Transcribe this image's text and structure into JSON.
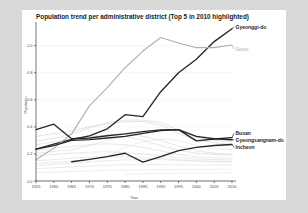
{
  "chart_data": {
    "type": "line",
    "title": "Population trend per administrative district (Top 5 in 2010 highlighted)",
    "xlabel": "Year",
    "ylabel": "Population",
    "x": [
      1955,
      1960,
      1965,
      1970,
      1975,
      1980,
      1985,
      1990,
      1995,
      2000,
      2005,
      2010
    ],
    "xticks": [
      "1955",
      "1960",
      "1965",
      "1970",
      "1975",
      "1980",
      "1985",
      "1990",
      "1995",
      "2000",
      "2005",
      "2010"
    ],
    "yticks": [
      "0.0",
      "0.2",
      "0.4",
      "0.6",
      "0.8",
      "1.0"
    ],
    "ytickvals": [
      0.0,
      0.2,
      0.4,
      0.6,
      0.8,
      1.0
    ],
    "xlim": [
      1955,
      2010
    ],
    "ylim": [
      0.0,
      1.16
    ],
    "grid": true,
    "legend": "inline-right-labels",
    "highlight_color": "#262626",
    "seoul_color": "#b0b0b0",
    "background_color": "#cfcfcf",
    "series": [
      {
        "name": "Gyeonggi-do",
        "highlighted": true,
        "color": "#262626",
        "label_x": 2010,
        "label_y": 1.14,
        "values": [
          0.235,
          0.272,
          0.308,
          0.334,
          0.386,
          0.49,
          0.476,
          0.66,
          0.8,
          0.9,
          1.03,
          1.125
        ]
      },
      {
        "name": "Seoul",
        "highlighted": true,
        "color": "#b0b0b0",
        "label_x": 2010,
        "label_y": 0.975,
        "values": [
          0.157,
          0.243,
          0.348,
          0.555,
          0.69,
          0.837,
          0.96,
          1.06,
          1.02,
          0.985,
          0.985,
          1.005
        ]
      },
      {
        "name": "Busan",
        "highlighted": true,
        "color": "#262626",
        "label_x": 2010,
        "label_y": 0.352,
        "values": [
          0.38,
          0.42,
          0.312,
          0.318,
          0.334,
          0.348,
          0.365,
          0.378,
          0.38,
          0.296,
          0.31,
          0.32
        ]
      },
      {
        "name": "Gyeongsangnam-do",
        "highlighted": true,
        "color": "#262626",
        "label_x": 2010,
        "label_y": 0.305,
        "values": [
          0.235,
          0.262,
          0.3,
          0.306,
          0.318,
          0.33,
          0.352,
          0.372,
          0.38,
          0.33,
          0.312,
          0.305
        ]
      },
      {
        "name": "Incheon",
        "highlighted": true,
        "color": "#262626",
        "label_x": 2010,
        "label_y": 0.248,
        "values": [
          null,
          null,
          0.142,
          0.16,
          0.18,
          0.205,
          0.14,
          0.18,
          0.225,
          0.248,
          0.262,
          0.27
        ]
      },
      {
        "name": "other-1",
        "highlighted": false,
        "color": "#cccccc",
        "values": [
          0.295,
          0.315,
          0.345,
          0.392,
          0.432,
          0.45,
          0.45,
          0.432,
          0.375,
          0.322,
          0.3,
          0.292
        ]
      },
      {
        "name": "other-2",
        "highlighted": false,
        "color": "#cfcfcf",
        "values": [
          0.33,
          0.35,
          0.368,
          0.402,
          0.42,
          0.438,
          0.44,
          0.412,
          0.352,
          0.3,
          0.282,
          0.272
        ]
      },
      {
        "name": "other-3",
        "highlighted": false,
        "color": "#d2d2d2",
        "values": [
          0.268,
          0.29,
          0.308,
          0.33,
          0.34,
          0.348,
          0.33,
          0.3,
          0.258,
          0.222,
          0.205,
          0.198
        ]
      },
      {
        "name": "other-4",
        "highlighted": false,
        "color": "#d5d5d5",
        "values": [
          0.225,
          0.24,
          0.255,
          0.268,
          0.275,
          0.268,
          0.248,
          0.222,
          0.196,
          0.178,
          0.17,
          0.168
        ]
      },
      {
        "name": "other-5",
        "highlighted": false,
        "color": "#d8d8d8",
        "values": [
          0.185,
          0.196,
          0.206,
          0.214,
          0.216,
          0.21,
          0.198,
          0.186,
          0.172,
          0.162,
          0.158,
          0.156
        ]
      },
      {
        "name": "other-6",
        "highlighted": false,
        "color": "#d8d8d8",
        "values": [
          0.15,
          0.158,
          0.168,
          0.176,
          0.18,
          0.178,
          0.172,
          0.166,
          0.158,
          0.15,
          0.146,
          0.144
        ]
      },
      {
        "name": "other-7",
        "highlighted": false,
        "color": "#dadada",
        "values": [
          0.112,
          0.122,
          0.132,
          0.142,
          0.15,
          0.156,
          0.158,
          0.158,
          0.152,
          0.146,
          0.142,
          0.14
        ]
      },
      {
        "name": "other-8",
        "highlighted": false,
        "color": "#dcdcdc",
        "values": [
          0.092,
          0.098,
          0.104,
          0.11,
          0.116,
          0.12,
          0.122,
          0.122,
          0.12,
          0.118,
          0.118,
          0.118
        ]
      },
      {
        "name": "other-9",
        "highlighted": false,
        "color": "#dedede",
        "values": [
          0.062,
          0.066,
          0.07,
          0.075,
          0.079,
          0.082,
          0.084,
          0.086,
          0.086,
          0.086,
          0.086,
          0.086
        ]
      },
      {
        "name": "other-10",
        "highlighted": false,
        "color": "#e0e0e0",
        "values": [
          null,
          null,
          null,
          null,
          null,
          0.05,
          0.052,
          0.054,
          0.056,
          0.058,
          0.06,
          0.062
        ]
      },
      {
        "name": "other-11",
        "highlighted": false,
        "color": "#dcdcdc",
        "values": [
          0.128,
          0.136,
          0.145,
          0.16,
          0.172,
          0.25,
          0.29,
          0.308,
          0.3,
          0.262,
          0.24,
          0.232
        ]
      },
      {
        "name": "other-12",
        "highlighted": false,
        "color": "#d6d6d6",
        "values": [
          0.205,
          0.218,
          0.232,
          0.262,
          0.3,
          0.33,
          0.3,
          0.262,
          0.228,
          0.205,
          0.196,
          0.19
        ]
      }
    ],
    "annotations": [
      {
        "text": "Gyeonggi-do",
        "bold": true,
        "color": "#222222"
      },
      {
        "text": "Seoul",
        "bold": false,
        "color": "#b0b0b0"
      },
      {
        "text": "Busan",
        "bold": true,
        "color": "#222222"
      },
      {
        "text": "Gyeongsangnam-do",
        "bold": true,
        "color": "#222222"
      },
      {
        "text": "Incheon",
        "bold": true,
        "color": "#222222"
      }
    ]
  }
}
